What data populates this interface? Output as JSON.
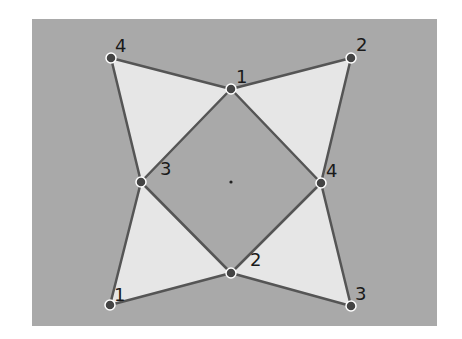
{
  "diagram": {
    "background_rect": {
      "x": 32,
      "y": 19,
      "width": 405,
      "height": 307,
      "color": "#a9a9a9"
    },
    "fill_color": "#e6e6e6",
    "line_color": "#555555",
    "dot_color": "#444444",
    "dot_rim_color": "#ffffff",
    "center": {
      "x": 231,
      "y": 182
    },
    "inner_square": [
      {
        "id": "top",
        "label": "1",
        "x": 231,
        "y": 89,
        "lx": 236,
        "ly": 83
      },
      {
        "id": "right",
        "label": "4",
        "x": 321,
        "y": 183,
        "lx": 326,
        "ly": 177
      },
      {
        "id": "bottom",
        "label": "2",
        "x": 231,
        "y": 273,
        "lx": 250,
        "ly": 266
      },
      {
        "id": "left",
        "label": "3",
        "x": 141,
        "y": 182,
        "lx": 160,
        "ly": 175
      }
    ],
    "outer_points": [
      {
        "id": "top-left",
        "label": "4",
        "x": 111,
        "y": 58,
        "lx": 115,
        "ly": 52
      },
      {
        "id": "top-right",
        "label": "2",
        "x": 351,
        "y": 58,
        "lx": 356,
        "ly": 51
      },
      {
        "id": "bottom-left",
        "label": "1",
        "x": 110,
        "y": 305,
        "lx": 114,
        "ly": 301
      },
      {
        "id": "bottom-right",
        "label": "3",
        "x": 351,
        "y": 306,
        "lx": 355,
        "ly": 300
      }
    ],
    "triangles": [
      {
        "name": "top-left-triangle",
        "points": [
          "top-left",
          "top",
          "left"
        ]
      },
      {
        "name": "top-right-triangle",
        "points": [
          "top-right",
          "right",
          "top"
        ]
      },
      {
        "name": "bottom-right-triangle",
        "points": [
          "bottom-right",
          "bottom",
          "right"
        ]
      },
      {
        "name": "bottom-left-triangle",
        "points": [
          "bottom-left",
          "left",
          "bottom"
        ]
      }
    ]
  }
}
